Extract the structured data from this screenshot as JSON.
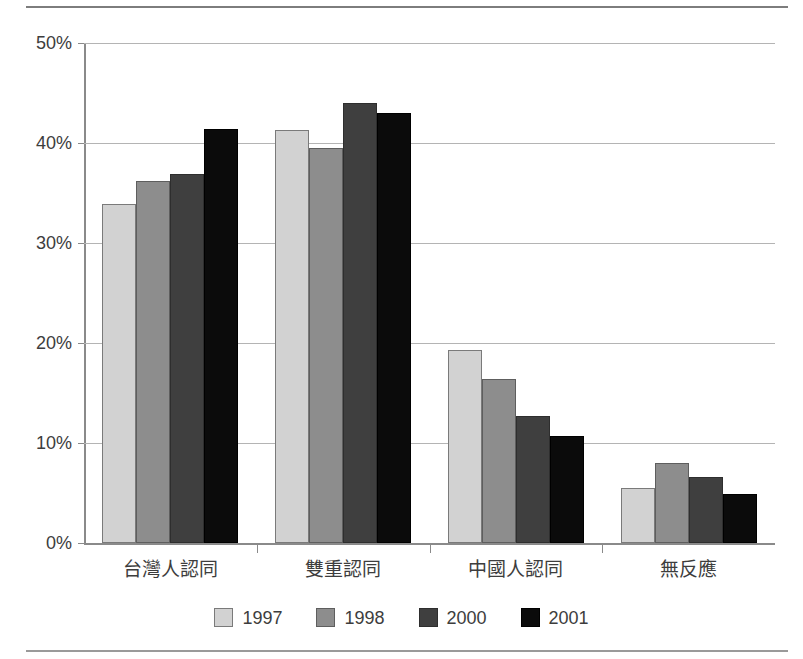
{
  "chart_data": {
    "type": "bar",
    "title": "",
    "subtitle": "",
    "xlabel": "",
    "ylabel": "",
    "categories": [
      "台灣人認同",
      "雙重認同",
      "中國人認同",
      "無反應"
    ],
    "series": [
      {
        "name": "1997",
        "color": "#d2d2d2",
        "values": [
          33.9,
          41.3,
          19.3,
          5.5
        ]
      },
      {
        "name": "1998",
        "color": "#8d8d8d",
        "values": [
          36.2,
          39.5,
          16.4,
          8.0
        ]
      },
      {
        "name": "2000",
        "color": "#3f3f3f",
        "values": [
          36.9,
          44.0,
          12.7,
          6.6
        ]
      },
      {
        "name": "2001",
        "color": "#0b0b0b",
        "values": [
          41.4,
          43.0,
          10.7,
          4.9
        ]
      }
    ],
    "ylim": [
      0,
      50
    ],
    "ytick_values": [
      0,
      10,
      20,
      30,
      40,
      50
    ],
    "ytick_labels": [
      "0%",
      "10%",
      "20%",
      "30%",
      "40%",
      "50%"
    ],
    "grid": true,
    "grid_axis": "y",
    "legend": true,
    "legend_position": "bottom",
    "legend_entries": [
      "1997",
      "1998",
      "2000",
      "2001"
    ]
  }
}
